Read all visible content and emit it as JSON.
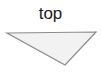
{
  "canvas": {
    "width": 101,
    "height": 80,
    "background_color": "#ffffff"
  },
  "label": {
    "text": "top",
    "color": "#1a1a1a",
    "font_size_px": 17,
    "position": "above-shape-centered"
  },
  "shape": {
    "name": "downward-triangle",
    "type": "triangle",
    "direction": "down",
    "fill_color": "#f2f2f2",
    "stroke_color": "#8c8c8c",
    "stroke_width": 1.2,
    "points": "7,7 96,6 65,39",
    "vertices": [
      {
        "label": "top-left",
        "x": 7,
        "y": 7
      },
      {
        "label": "top-right",
        "x": 96,
        "y": 6
      },
      {
        "label": "bottom-apex",
        "x": 65,
        "y": 39
      }
    ]
  }
}
